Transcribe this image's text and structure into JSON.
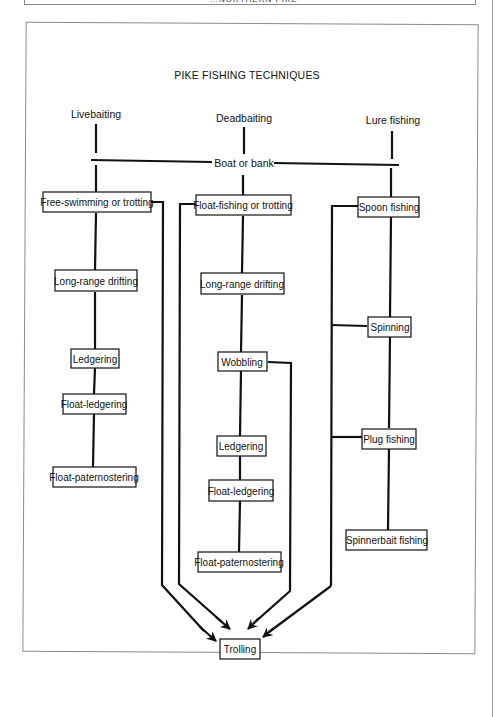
{
  "page": {
    "header_caption": "…NORTHERN PIKE"
  },
  "diagram": {
    "title": "PIKE FISHING TECHNIQUES",
    "shared_label": "Boat or bank",
    "columns": [
      {
        "label": "Livebaiting",
        "nodes": [
          "Free-swimming or trotting",
          "Long-range drifting",
          "Ledgering",
          "Float-ledgering",
          "Float-paternostering"
        ]
      },
      {
        "label": "Deadbaiting",
        "nodes": [
          "Float-fishing or trotting",
          "Long-range drifting",
          "Wobbling",
          "Ledgering",
          "Float-ledgering",
          "Float-paternostering"
        ]
      },
      {
        "label": "Lure fishing",
        "nodes": [
          "Spoon fishing",
          "Spinning",
          "Plug fishing",
          "Spinnerbait fishing"
        ]
      }
    ],
    "sink_node": "Trolling",
    "edges_to_sink": [
      "Free-swimming or trotting",
      "Float-fishing or trotting",
      "Wobbling",
      "Spoon fishing"
    ]
  }
}
